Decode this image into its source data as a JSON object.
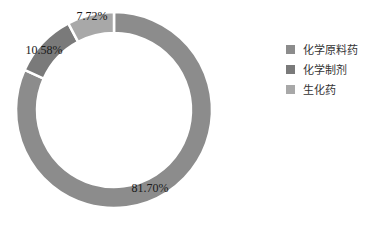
{
  "chart_data": {
    "type": "pie",
    "variant": "donut",
    "title": "",
    "categories": [
      "化学原料药",
      "化学制剂",
      "生化药"
    ],
    "values": [
      81.7,
      10.58,
      7.72
    ],
    "labels": [
      "81.70%",
      "10.58%",
      "7.72%"
    ],
    "colors": [
      "#8c8c8c",
      "#7a7a7a",
      "#a8a8a8"
    ],
    "start_angle": "12 o'clock",
    "direction": "clockwise",
    "legend_position": "right"
  },
  "legend": {
    "items": [
      {
        "label": "化学原料药",
        "color": "#8c8c8c"
      },
      {
        "label": "化学制剂",
        "color": "#7a7a7a"
      },
      {
        "label": "生化药",
        "color": "#a8a8a8"
      }
    ]
  }
}
